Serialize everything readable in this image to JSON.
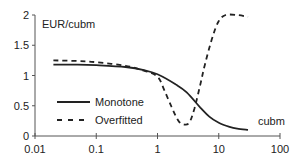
{
  "chart_data": {
    "type": "line",
    "title": "",
    "xlabel": "cubm",
    "ylabel": "EUR/cubm",
    "xscale": "log",
    "xlim": [
      0.01,
      100
    ],
    "ylim": [
      0,
      2
    ],
    "xticks": [
      "0.01",
      "0.1",
      "1",
      "10",
      "100"
    ],
    "yticks": [
      "0",
      "0.5",
      "1",
      "1.5",
      "2"
    ],
    "grid": false,
    "legend_position": "lower-left-inside",
    "series": [
      {
        "name": "Monotone",
        "style": "solid",
        "color": "#222222",
        "x": [
          0.02,
          0.05,
          0.1,
          0.3,
          0.6,
          1,
          2,
          3,
          5,
          7,
          10,
          15,
          20,
          30
        ],
        "y": [
          1.18,
          1.18,
          1.17,
          1.14,
          1.09,
          1.02,
          0.85,
          0.72,
          0.47,
          0.32,
          0.22,
          0.15,
          0.12,
          0.1
        ]
      },
      {
        "name": "Overfitted",
        "style": "dashed",
        "color": "#222222",
        "x": [
          0.02,
          0.05,
          0.1,
          0.3,
          0.6,
          1,
          1.3,
          1.7,
          2.2,
          2.7,
          3.3,
          4,
          5,
          6,
          8,
          10,
          13,
          20,
          30
        ],
        "y": [
          1.25,
          1.24,
          1.22,
          1.16,
          1.08,
          0.98,
          0.75,
          0.48,
          0.25,
          0.19,
          0.22,
          0.45,
          0.85,
          1.2,
          1.65,
          1.9,
          2.0,
          2.0,
          1.97
        ]
      }
    ]
  }
}
